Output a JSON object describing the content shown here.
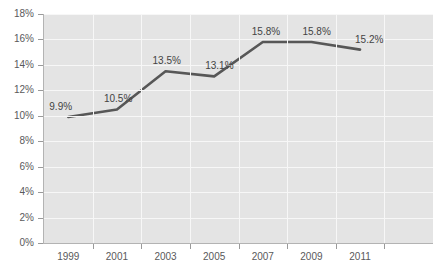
{
  "chart_data": {
    "type": "line",
    "title": "",
    "subtitle": "",
    "xlabel": "",
    "ylabel": "",
    "categories": [
      "1999",
      "2001",
      "2003",
      "2005",
      "2007",
      "2009",
      "2011"
    ],
    "values": [
      9.9,
      10.5,
      13.5,
      13.1,
      15.8,
      15.8,
      15.2
    ],
    "data_labels": [
      "9.9%",
      "10.5%",
      "13.5%",
      "13.1%",
      "15.8%",
      "15.8%",
      "15.2%"
    ],
    "series": [
      {
        "name": "",
        "values": [
          9.9,
          10.5,
          13.5,
          13.1,
          15.8,
          15.8,
          15.2
        ]
      }
    ],
    "ylim": [
      0,
      18
    ],
    "ytick_step": 2,
    "ytick_labels": [
      "0%",
      "2%",
      "4%",
      "6%",
      "8%",
      "10%",
      "12%",
      "14%",
      "16%",
      "18%"
    ],
    "ytick_values": [
      0,
      2,
      4,
      6,
      8,
      10,
      12,
      14,
      16,
      18
    ],
    "xtick_labels": [
      "1999",
      "2001",
      "2003",
      "2005",
      "2007",
      "2009",
      "2011"
    ],
    "grid": true,
    "grid_color": "#f7f7f7",
    "legend": false,
    "legend_position": "none",
    "plot_background": "#e4e4e4",
    "page_background": "#ffffff",
    "line_color": "#575757",
    "label_color": "#434343",
    "axis_label_color": "#59595b",
    "axis_color": "#b3b3b3"
  }
}
